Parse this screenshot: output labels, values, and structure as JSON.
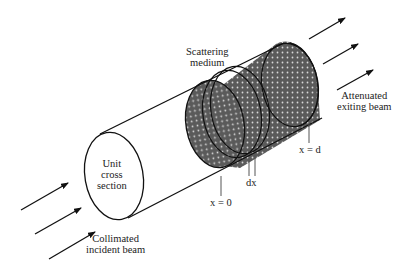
{
  "diagram": {
    "labels": {
      "scattering_medium": [
        "Scattering",
        "medium"
      ],
      "attenuated": [
        "Attenuated",
        "exiting beam"
      ],
      "unit_cross": [
        "Unit",
        "cross",
        "section"
      ],
      "collimated": [
        "Collimated",
        "incident beam"
      ],
      "x_zero": "x = 0",
      "dx": "dx",
      "x_d": "x = d"
    },
    "colors": {
      "line": "#111111",
      "medium_fill": "#5a5a5a",
      "medium_dot": "#d8d8d8"
    }
  }
}
